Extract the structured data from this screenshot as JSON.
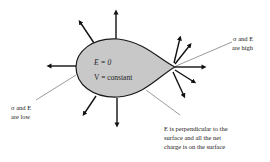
{
  "diagram": {
    "conductor": {
      "inside_field": "E  =  0",
      "inside_potential": "V  =  constant",
      "fill_color": "#c8c8c8",
      "stroke_color": "#1a1a1a"
    },
    "annotations": {
      "high": {
        "line1": "σ and E",
        "line2": "are high"
      },
      "low": {
        "line1": "σ and E",
        "line2": "are low"
      },
      "surface": {
        "line1": "E is perpendicular to the",
        "line2": "surface and all the net",
        "line3": "charge is on the surface"
      }
    },
    "arrows": {
      "count": 11,
      "description": "Electric field lines perpendicular to conductor surface, denser at the pointed end"
    }
  }
}
